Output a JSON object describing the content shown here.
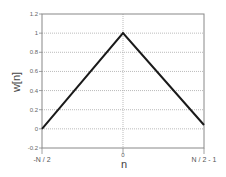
{
  "chart_data": {
    "type": "line",
    "title": "",
    "xlabel": "n",
    "ylabel": "w[n]",
    "x_tick_labels": [
      "-N / 2",
      "0",
      "N / 2 - 1"
    ],
    "y_ticks": [
      -0.2,
      0,
      0.2,
      0.4,
      0.6,
      0.8,
      1,
      1.2
    ],
    "y_tick_labels": [
      "-0.2",
      "0",
      "0.2",
      "0.4",
      "0.6",
      "0.8",
      "1",
      "1.2"
    ],
    "ylim": [
      -0.2,
      1.2
    ],
    "grid": true,
    "legend": null,
    "series": [
      {
        "name": "w[n]",
        "x": [
          "-N/2",
          "0",
          "N/2-1"
        ],
        "x_norm": [
          0,
          0.5,
          1.0
        ],
        "values": [
          0,
          1,
          0.04
        ]
      }
    ],
    "colors": {
      "line": "#1a1a1a",
      "grid": "#aaaaaa",
      "axes": "#888888"
    }
  }
}
